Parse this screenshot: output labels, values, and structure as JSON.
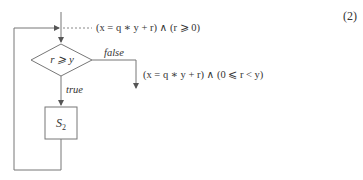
{
  "equation_number": "(2)",
  "precondition": "(x = q ∗ y + r) ∧ (r ⩾ 0)",
  "postcondition": "(x = q ∗ y + r) ∧ (0 ⩽ r < y)",
  "decision": {
    "condition": "r ⩾ y",
    "false_label": "false",
    "true_label": "true"
  },
  "statement_box": {
    "label": "S",
    "subscript": "2"
  },
  "colors": {
    "line": "#777777",
    "text": "#333333"
  }
}
